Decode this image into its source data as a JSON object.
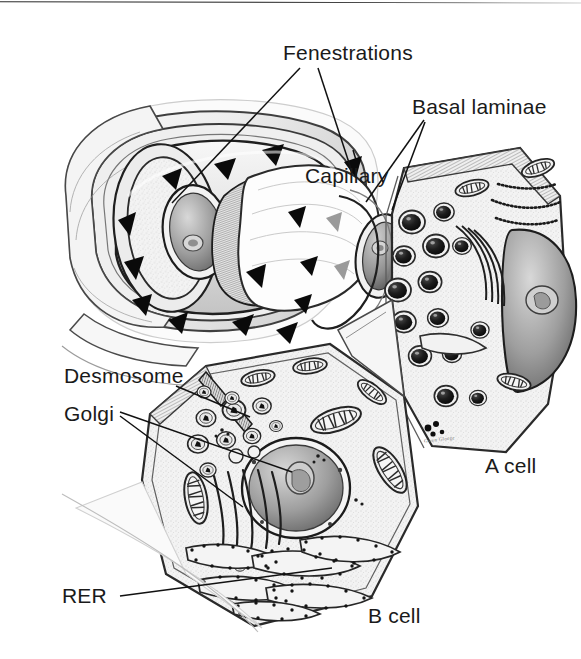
{
  "figure": {
    "kind": "scientific-illustration",
    "technique": "pen-and-ink stipple line drawing, grayscale",
    "background_color": "#ffffff",
    "ink_color": "#1a1a1a",
    "signature": "Gwen Gloege"
  },
  "labels": [
    {
      "id": "fenestrations",
      "text": "Fenestrations",
      "x": 283,
      "y": 42,
      "anchor": "left"
    },
    {
      "id": "basal-laminae",
      "text": "Basal laminae",
      "x": 412,
      "y": 96,
      "anchor": "left"
    },
    {
      "id": "capillary",
      "text": "Capillary",
      "x": 305,
      "y": 165,
      "anchor": "left"
    },
    {
      "id": "desmosome",
      "text": "Desmosome",
      "x": 64,
      "y": 365,
      "anchor": "left"
    },
    {
      "id": "golgi",
      "text": "Golgi",
      "x": 64,
      "y": 403,
      "anchor": "left"
    },
    {
      "id": "rer",
      "text": "RER",
      "x": 62,
      "y": 585,
      "anchor": "left"
    },
    {
      "id": "a-cell",
      "text": "A cell",
      "x": 485,
      "y": 455,
      "anchor": "left"
    },
    {
      "id": "b-cell",
      "text": "B cell",
      "x": 368,
      "y": 605,
      "anchor": "left"
    }
  ],
  "leader_lines": [
    {
      "id": "fenestrations-leader-1",
      "from_label": "Fenestrations",
      "to_feature": "capillary-fenestration-pore-upper-left",
      "path": "M300,68 L172,203"
    },
    {
      "id": "fenestrations-leader-2",
      "from_label": "Fenestrations",
      "to_feature": "capillary-fenestration-pore-right",
      "path": "M318,68 L352,172"
    },
    {
      "id": "basal-laminae-leader-1",
      "from_label": "Basal laminae",
      "to_feature": "basal-lamina-sheath-outer",
      "path": "M424,120 L368,200"
    },
    {
      "id": "basal-laminae-leader-2",
      "from_label": "Basal laminae",
      "to_feature": "basal-lamina-sheath-inner",
      "path": "M424,122 L392,208"
    },
    {
      "id": "capillary-leader",
      "from_label": "Capillary",
      "to_feature": "capillary-lumen-pore",
      "path": "M355,160 L352,150"
    },
    {
      "id": "desmosome-leader",
      "from_label": "Desmosome",
      "to_feature": "desmosome-junction-b-cell-membrane",
      "path": "M176,386 L250,416"
    },
    {
      "id": "golgi-leader-1",
      "from_label": "Golgi",
      "to_feature": "golgi-stack-b-cell",
      "path": "M118,413 L292,472"
    },
    {
      "id": "golgi-leader-2",
      "from_label": "Golgi",
      "to_feature": "golgi-cisternae-b-cell",
      "path": "M118,416 L245,506"
    },
    {
      "id": "rer-leader",
      "from_label": "RER",
      "to_feature": "rough-er-cisternae-b-cell",
      "path": "M118,596 L330,570"
    }
  ],
  "structures": [
    {
      "id": "capillary",
      "name": "Fenestrated capillary",
      "description": "Cut-away cylindrical endothelial tube, upper-left of figure, with triangular fenestration pores and an endothelial nucleus"
    },
    {
      "id": "basal-laminae",
      "name": "Basal laminae",
      "description": "Concentric pale sheath layers wrapping the capillary and separating it from the endocrine cells"
    },
    {
      "id": "a-cell",
      "name": "A cell",
      "description": "Glucagon-secreting cell, right side, packed with dark round secretory granules, mitochondria, Golgi and a nucleus"
    },
    {
      "id": "b-cell",
      "name": "B cell",
      "description": "Insulin-secreting cell, lower centre, with large nucleus and nucleolus, Golgi stack, mitochondria and studded rough ER"
    },
    {
      "id": "fenestrations",
      "name": "Fenestrations",
      "description": "Dark triangular pores piercing the thin endothelial wall of the capillary"
    },
    {
      "id": "desmosome",
      "name": "Desmosome",
      "description": "Hatched plaque-like junction on the upper-left B cell membrane"
    },
    {
      "id": "golgi",
      "name": "Golgi apparatus",
      "description": "Stack of curved flattened cisternae beside the B cell nucleus"
    },
    {
      "id": "rer",
      "name": "Rough endoplasmic reticulum",
      "description": "Ribosome-studded flattened cisternae filling the lower part of the B cell"
    }
  ]
}
